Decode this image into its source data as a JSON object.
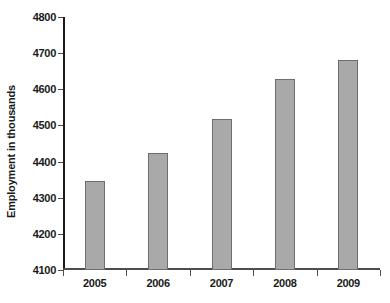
{
  "chart_data": {
    "type": "bar",
    "title": "",
    "xlabel": "",
    "ylabel": "Employment in thousands",
    "categories": [
      "2005",
      "2006",
      "2007",
      "2008",
      "2009"
    ],
    "values": [
      4345,
      4423,
      4517,
      4628,
      4680
    ],
    "ylim": [
      4100,
      4800
    ],
    "yticks": [
      4100,
      4200,
      4300,
      4400,
      4500,
      4600,
      4700,
      4800
    ],
    "ytick_labels": [
      "4100",
      "4200",
      "4300",
      "4400",
      "4500",
      "4600",
      "4700",
      "4800"
    ],
    "grid": false,
    "legend": null,
    "series": [
      {
        "name": "Employment",
        "values": [
          4345,
          4423,
          4517,
          4628,
          4680
        ]
      }
    ],
    "bar_color": "#a9a9a9",
    "bar_edge_color": "#6e6e6e",
    "axis_color": "#1a1a1a",
    "background_color": "#ffffff"
  }
}
